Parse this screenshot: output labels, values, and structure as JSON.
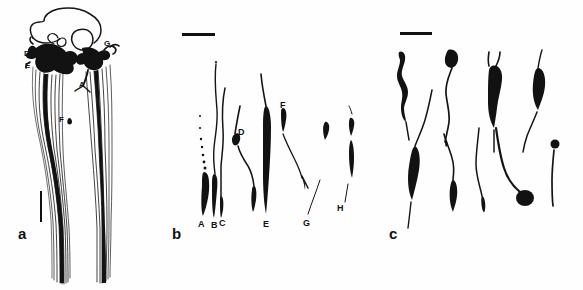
{
  "figure": {
    "type": "scientific-line-drawing",
    "background_color": "#ffffff",
    "ink_color": "#121212",
    "width": 583,
    "height": 290,
    "panel_count": 3
  },
  "panels": [
    {
      "id": "a",
      "letter": "a",
      "letter_x": 18,
      "letter_y": 226,
      "description": "whole-mount camera lucida drawing of ganglion with two descending axon bundles",
      "scalebar": {
        "orientation": "vertical",
        "x": 40,
        "y": 191,
        "length": 31,
        "thickness": 2
      },
      "labels": [
        {
          "text": "D",
          "x": 24,
          "y": 54
        },
        {
          "text": "E",
          "x": 25,
          "y": 66
        },
        {
          "text": "G",
          "x": 104,
          "y": 44
        },
        {
          "text": "A",
          "x": 79,
          "y": 85
        },
        {
          "text": "F",
          "x": 61,
          "y": 120
        }
      ]
    },
    {
      "id": "b",
      "letter": "b",
      "letter_x": 172,
      "letter_y": 226,
      "description": "eight individually traced neurons with somata and descending processes",
      "scalebar": {
        "orientation": "horizontal",
        "x": 182,
        "y": 34,
        "length": 33,
        "thickness": 3
      },
      "labels": [
        {
          "text": "A",
          "x": 199,
          "y": 225
        },
        {
          "text": "B",
          "x": 212,
          "y": 226
        },
        {
          "text": "C",
          "x": 221,
          "y": 224
        },
        {
          "text": "D",
          "x": 238,
          "y": 133
        },
        {
          "text": "E",
          "x": 264,
          "y": 225
        },
        {
          "text": "F",
          "x": 280,
          "y": 106
        },
        {
          "text": "G",
          "x": 303,
          "y": 224
        },
        {
          "text": "H",
          "x": 337,
          "y": 209
        }
      ]
    },
    {
      "id": "c",
      "letter": "c",
      "letter_x": 389,
      "letter_y": 226,
      "description": "nine isolated dissociated neurons, unlabeled",
      "scalebar": {
        "orientation": "horizontal",
        "x": 400,
        "y": 32,
        "length": 32,
        "thickness": 3
      },
      "labels": []
    }
  ]
}
